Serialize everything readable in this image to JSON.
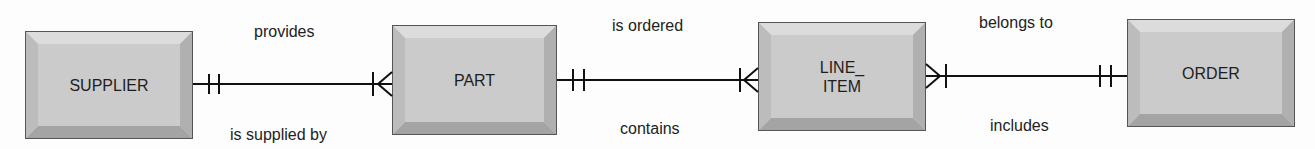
{
  "entities": [
    {
      "id": "supplier",
      "label": "SUPPLIER"
    },
    {
      "id": "part",
      "label": "PART"
    },
    {
      "id": "line_item",
      "label": "LINE_\nITEM"
    },
    {
      "id": "order",
      "label": "ORDER"
    }
  ],
  "relationships": [
    {
      "from": "SUPPLIER",
      "to": "PART",
      "top_label": "provides",
      "bottom_label": "is supplied by",
      "from_cardinality": "one-and-only-one",
      "to_cardinality": "one-or-many"
    },
    {
      "from": "PART",
      "to": "LINE_ITEM",
      "top_label": "is ordered",
      "bottom_label": "contains",
      "from_cardinality": "one-and-only-one",
      "to_cardinality": "one-or-many"
    },
    {
      "from": "LINE_ITEM",
      "to": "ORDER",
      "top_label": "belongs to",
      "bottom_label": "includes",
      "from_cardinality": "one-or-many",
      "to_cardinality": "one-and-only-one"
    }
  ]
}
